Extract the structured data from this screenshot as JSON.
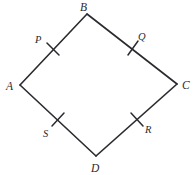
{
  "figure": {
    "kind": "geometry-diagram",
    "shape_name": "quadrilateral",
    "width": 196,
    "height": 175,
    "background_color": "#ffffff",
    "stroke_color": "#2a2a30",
    "stroke_width": 1.6,
    "tick_stroke_width": 1.5,
    "label_color": "#2a2a30"
  },
  "vertices": [
    {
      "id": "A",
      "label": "A",
      "x": 20,
      "y": 85,
      "label_x": 6,
      "label_y": 90
    },
    {
      "id": "B",
      "label": "B",
      "x": 87,
      "y": 14,
      "label_x": 80,
      "label_y": 11
    },
    {
      "id": "C",
      "label": "C",
      "x": 177,
      "y": 84,
      "label_x": 182,
      "label_y": 89
    },
    {
      "id": "D",
      "label": "D",
      "x": 96,
      "y": 156,
      "label_x": 91,
      "label_y": 172
    }
  ],
  "sides": [
    {
      "id": "AB",
      "from": "A",
      "to": "B",
      "x1": 20,
      "y1": 85,
      "x2": 87,
      "y2": 14
    },
    {
      "id": "BC",
      "from": "B",
      "to": "C",
      "x1": 87,
      "y1": 14,
      "x2": 177,
      "y2": 84
    },
    {
      "id": "CD",
      "from": "C",
      "to": "D",
      "x1": 177,
      "y1": 84,
      "x2": 96,
      "y2": 156
    },
    {
      "id": "DA",
      "from": "D",
      "to": "A",
      "x1": 96,
      "y1": 156,
      "x2": 20,
      "y2": 85
    }
  ],
  "midpoints": [
    {
      "id": "P",
      "label": "P",
      "on_side": "AB",
      "x": 53,
      "y": 49,
      "tick_x1": 47,
      "tick_y1": 43,
      "tick_x2": 59,
      "tick_y2": 55,
      "label_x": 35,
      "label_y": 43
    },
    {
      "id": "Q",
      "label": "Q",
      "on_side": "BC",
      "x": 133,
      "y": 48,
      "tick_x1": 128,
      "tick_y1": 55,
      "tick_x2": 138,
      "tick_y2": 41,
      "label_x": 138,
      "label_y": 40
    },
    {
      "id": "R",
      "label": "R",
      "on_side": "CD",
      "x": 137,
      "y": 119,
      "tick_x1": 131,
      "tick_y1": 113,
      "tick_x2": 143,
      "tick_y2": 126,
      "label_x": 145,
      "label_y": 133
    },
    {
      "id": "S",
      "label": "S",
      "on_side": "DA",
      "x": 58,
      "y": 120,
      "tick_x1": 52,
      "tick_y1": 126,
      "tick_x2": 64,
      "tick_y2": 113,
      "label_x": 43,
      "label_y": 137
    }
  ],
  "icons": {
    "tick_mark": "tick-mark-icon"
  }
}
